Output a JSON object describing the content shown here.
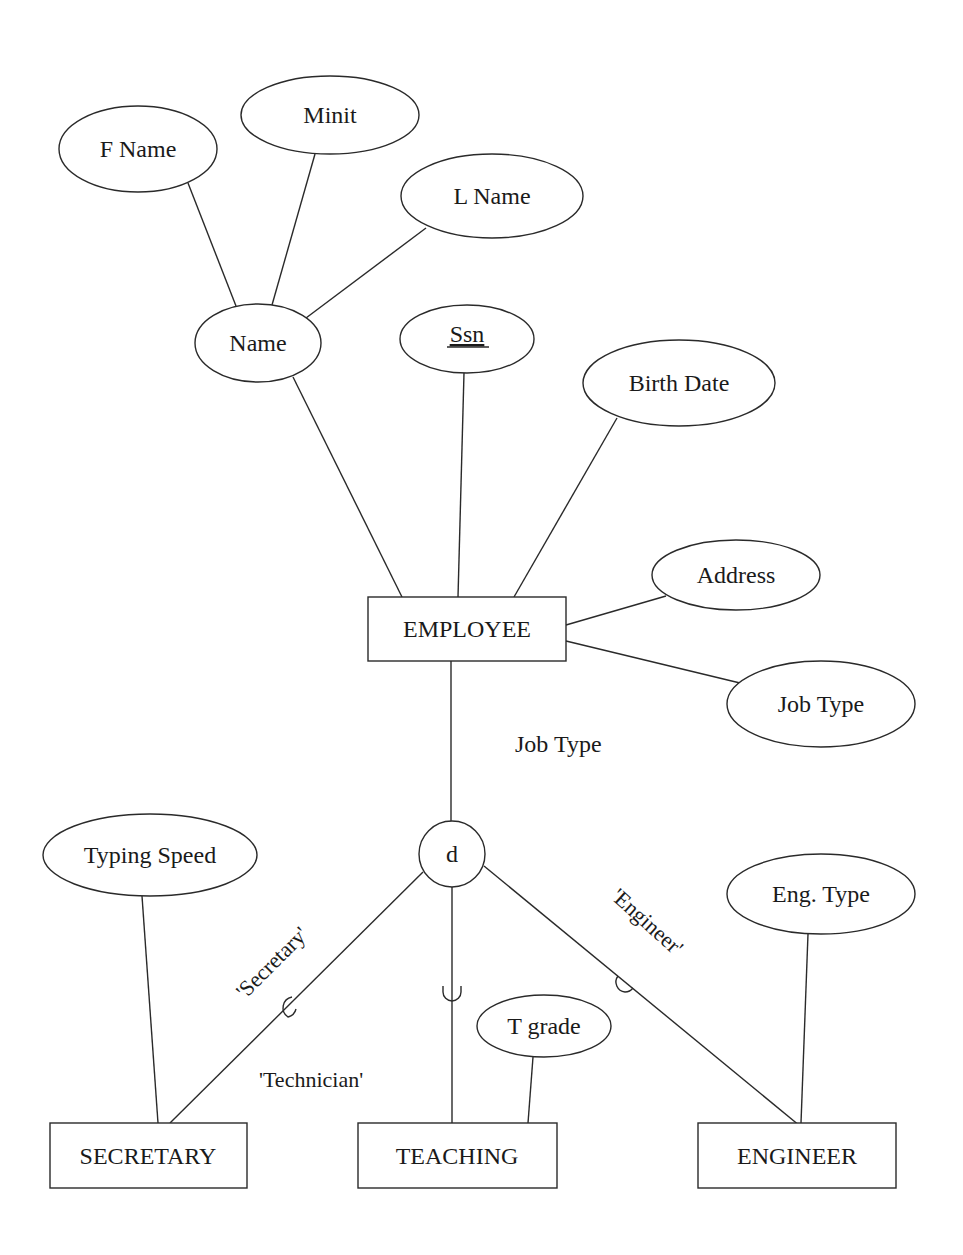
{
  "diagram": {
    "stroke_color": "#2a2a2a",
    "background": "#ffffff",
    "entities": [
      {
        "id": "employee",
        "label": "EMPLOYEE",
        "x": 368,
        "y": 597,
        "w": 198,
        "h": 64
      },
      {
        "id": "secretary",
        "label": "SECRETARY",
        "x": 50,
        "y": 1123,
        "w": 197,
        "h": 65
      },
      {
        "id": "teaching",
        "label": "TEACHING",
        "x": 358,
        "y": 1123,
        "w": 199,
        "h": 65
      },
      {
        "id": "engineer",
        "label": "ENGINEER",
        "x": 698,
        "y": 1123,
        "w": 198,
        "h": 65
      }
    ],
    "attributes": [
      {
        "id": "fname",
        "label": "F Name",
        "cx": 138,
        "cy": 149,
        "rx": 79,
        "ry": 43,
        "key": false
      },
      {
        "id": "minit",
        "label": "Minit",
        "cx": 330,
        "cy": 115,
        "rx": 89,
        "ry": 39,
        "key": false
      },
      {
        "id": "lname",
        "label": "L Name",
        "cx": 492,
        "cy": 196,
        "rx": 91,
        "ry": 42,
        "key": false
      },
      {
        "id": "name",
        "label": "Name",
        "cx": 258,
        "cy": 343,
        "rx": 63,
        "ry": 39,
        "key": false
      },
      {
        "id": "ssn",
        "label": "Ssn",
        "cx": 467,
        "cy": 339,
        "rx": 67,
        "ry": 34,
        "key": true
      },
      {
        "id": "birthdate",
        "label": "Birth Date",
        "cx": 679,
        "cy": 383,
        "rx": 96,
        "ry": 43,
        "key": false
      },
      {
        "id": "address",
        "label": "Address",
        "cx": 736,
        "cy": 575,
        "rx": 84,
        "ry": 35,
        "key": false
      },
      {
        "id": "jobtype",
        "label": "Job Type",
        "cx": 821,
        "cy": 704,
        "rx": 94,
        "ry": 43,
        "key": false
      },
      {
        "id": "typingspeed",
        "label": "Typing Speed",
        "cx": 150,
        "cy": 855,
        "rx": 107,
        "ry": 41,
        "key": false
      },
      {
        "id": "tgrade",
        "label": "T grade",
        "cx": 544,
        "cy": 1026,
        "rx": 67,
        "ry": 31,
        "key": false
      },
      {
        "id": "engtype",
        "label": "Eng. Type",
        "cx": 821,
        "cy": 894,
        "rx": 94,
        "ry": 40,
        "key": false
      }
    ],
    "specialization": {
      "symbol": "d",
      "meaning": "disjoint",
      "cx": 452,
      "cy": 854,
      "r": 33,
      "defining_attribute_label": "Job Type",
      "branch_labels": {
        "secretary": "'Secretary'",
        "teaching": "'Technician'",
        "engineer": "'Engineer'"
      }
    },
    "relationships": [
      {
        "from": "fname",
        "to": "name"
      },
      {
        "from": "minit",
        "to": "name"
      },
      {
        "from": "lname",
        "to": "name"
      },
      {
        "from": "name",
        "to": "employee"
      },
      {
        "from": "ssn",
        "to": "employee"
      },
      {
        "from": "birthdate",
        "to": "employee"
      },
      {
        "from": "address",
        "to": "employee"
      },
      {
        "from": "jobtype",
        "to": "employee"
      },
      {
        "from": "employee",
        "to": "d"
      },
      {
        "from": "d",
        "to": "secretary"
      },
      {
        "from": "d",
        "to": "teaching"
      },
      {
        "from": "d",
        "to": "engineer"
      },
      {
        "from": "typingspeed",
        "to": "secretary"
      },
      {
        "from": "tgrade",
        "to": "teaching"
      },
      {
        "from": "engtype",
        "to": "engineer"
      }
    ]
  }
}
